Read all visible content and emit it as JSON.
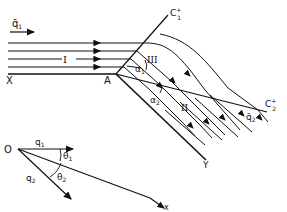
{
  "figure": {
    "labels": {
      "q1_bar": "q̄",
      "q1_bar_sub": "1",
      "region_1": "I",
      "region_2": "II",
      "region_3": "III",
      "x_point": "X",
      "a_point": "A",
      "y_point": "Y",
      "c1": "C",
      "c1_sup": "+",
      "c1_sub": "1",
      "c2": "C",
      "c2_sup": "+",
      "c2_sub": "2",
      "alpha1": "α",
      "alpha1_sub": "1",
      "alpha2": "α",
      "alpha2_sub": "2",
      "q2_bar": "q̄",
      "q2_bar_sub": "2"
    },
    "vector_diagram": {
      "origin": "O",
      "q1": "q",
      "q1_sub": "1",
      "q2": "q",
      "q2_sub": "2",
      "theta1": "θ",
      "theta1_sub": "1",
      "theta2": "θ",
      "theta2_sub": "2",
      "x_axis": "x"
    },
    "colors": {
      "ink": "#111111",
      "background": "#ffffff"
    }
  }
}
